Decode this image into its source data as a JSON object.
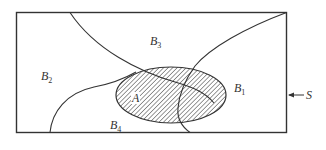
{
  "figure": {
    "type": "venn-partition-diagram",
    "sample_space": {
      "label": "S"
    },
    "event": {
      "label": "A",
      "fill": "hatched"
    },
    "partitions": [
      {
        "label": "B",
        "subscript": "1"
      },
      {
        "label": "B",
        "subscript": "2"
      },
      {
        "label": "B",
        "subscript": "3"
      },
      {
        "label": "B",
        "subscript": "4"
      }
    ],
    "colors": {
      "stroke": "#333333",
      "background": "#ffffff"
    }
  }
}
